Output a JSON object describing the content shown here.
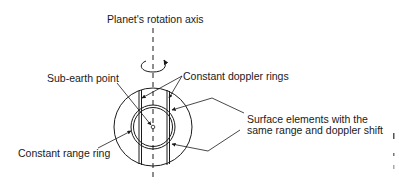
{
  "labels": {
    "rotation_axis": "Planet's rotation axis",
    "sub_earth_point": "Sub-earth point",
    "constant_doppler_rings": "Constant doppler rings",
    "surface_elements_line1": "Surface elements with the",
    "surface_elements_line2": "same range and doppler shift",
    "constant_range_ring": "Constant range ring"
  },
  "colors": {
    "stroke": "#1a1a1a",
    "background": "#ffffff"
  }
}
